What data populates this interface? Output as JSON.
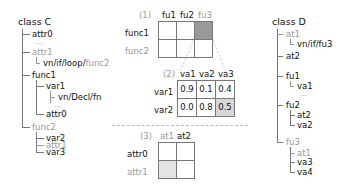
{
  "classC": {
    "title": "class C",
    "nodes": {
      "attr0": "attr0",
      "attr0_child": "...",
      "attr1": "attr1",
      "attr1_path_a": "vn/if/loop/",
      "attr1_path_b": "func2",
      "func1": "func1",
      "var1": "var1",
      "var1_child": "vn/Decl/fn",
      "var1_more": "...",
      "func1_attr0": "attr0",
      "func2": "func2",
      "var2": "var2",
      "func2_attr1": "attr1",
      "var3": "var3"
    }
  },
  "classD": {
    "title": "class D",
    "nodes": {
      "at1": "at1",
      "at1_path": "vn/if/fu3",
      "at2": "at2",
      "fu1": "fu1",
      "va1": "va1",
      "va1_more": "...",
      "fu2": "fu2",
      "fu2_at2": "at2",
      "va2": "va2",
      "fu3": "fu3",
      "fu3_at1": "at1",
      "va3": "va3",
      "va4": "va4"
    }
  },
  "matrix1": {
    "label": "(1)",
    "cols": [
      "fu1",
      "fu2",
      "fu3"
    ],
    "rows": [
      "func1",
      "func2"
    ],
    "highlight": {
      "row": 0,
      "col": 2,
      "color": "#999999"
    }
  },
  "matrix2": {
    "label": "(2)",
    "cols": [
      "va1",
      "va2",
      "va3"
    ],
    "rows": [
      "var1",
      "var2"
    ],
    "values": [
      [
        "0.9",
        "0.1",
        "0.4"
      ],
      [
        "0.0",
        "0.8",
        "0.5"
      ]
    ],
    "highlight": {
      "row": 1,
      "col": 2,
      "color": "#d6d6d6"
    }
  },
  "matrix3": {
    "label": "(3)",
    "cols": [
      "at1",
      "at2"
    ],
    "rows": [
      "attr0",
      "attr1"
    ],
    "highlight": {
      "row": 1,
      "col": 0,
      "color": "#e3e3e3"
    }
  }
}
